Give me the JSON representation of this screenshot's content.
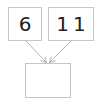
{
  "diagram": {
    "type": "number-bond",
    "top_left": {
      "value": "6"
    },
    "top_right": {
      "value": "11"
    },
    "bottom": {
      "value": ""
    }
  },
  "colors": {
    "box_border": "#c6c6c6",
    "arrow": "#b4b4b4",
    "text": "#222222",
    "background": "#ffffff"
  }
}
